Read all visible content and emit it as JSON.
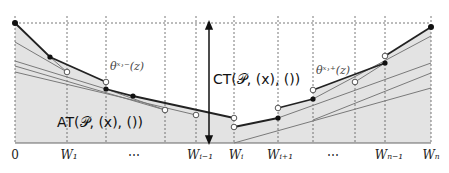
{
  "diagram": {
    "x_ticks": [
      "0",
      "W₁",
      "⋯",
      "Wᵢ₋₁",
      "Wᵢ",
      "Wᵢ₊₁",
      "⋯",
      "Wₙ₋₁",
      "Wₙ"
    ],
    "annotations": {
      "theta_minus": "θˣ˒⁻(z)",
      "theta_plus": "θˣ˒⁺(z)",
      "ct": "CT(𝒫, (x), ())",
      "at": "AT(𝒫, (x), ())"
    },
    "colors": {
      "fill": "#e3e3e3",
      "envelope": "#222222",
      "lines": "#7a7a7a",
      "grid": "#555555"
    }
  }
}
